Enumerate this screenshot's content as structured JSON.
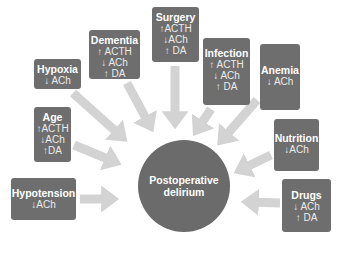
{
  "diagram": {
    "center": {
      "line1": "Postoperative",
      "line2": "delirium"
    },
    "factors": [
      {
        "id": "surgery",
        "title": "Surgery",
        "lines": [
          "↑ACTH",
          "↓ACh",
          "↑ DA"
        ]
      },
      {
        "id": "dementia",
        "title": "Dementia",
        "lines": [
          "↑ ACTH",
          "↓ ACh",
          "↑ DA"
        ]
      },
      {
        "id": "hypoxia",
        "title": "Hypoxia",
        "lines": [
          "↓ ACh"
        ]
      },
      {
        "id": "age",
        "title": "Age",
        "lines": [
          "↑ACTH",
          "↓ACh",
          "↑DA"
        ]
      },
      {
        "id": "hypotension",
        "title": "Hypotension",
        "lines": [
          "↓ACh"
        ]
      },
      {
        "id": "infection",
        "title": "Infection",
        "lines": [
          "↑ ACTH",
          "↓ ACh",
          "↑ DA"
        ]
      },
      {
        "id": "anemia",
        "title": "Anemia",
        "lines": [
          "↓ ACh"
        ]
      },
      {
        "id": "nutrition",
        "title": "Nutrition",
        "lines": [
          "↓ACh"
        ]
      },
      {
        "id": "drugs",
        "title": "Drugs",
        "lines": [
          "↓ ACh",
          "↑ DA"
        ]
      }
    ],
    "colors": {
      "box": "#6e6e6e",
      "circle": "#6b6b6b",
      "arrow": "#d3d3d3",
      "text": "#ffffff"
    }
  }
}
